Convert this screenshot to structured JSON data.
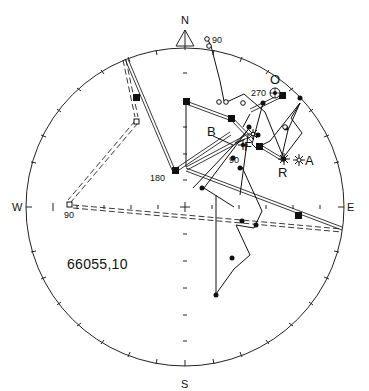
{
  "diagram": {
    "type": "stereonet",
    "caption": "66055,10",
    "compass": {
      "north": "N",
      "south": "S",
      "east": "E",
      "west": "W"
    },
    "labels": {
      "origin_marker": "O",
      "point_a": "A",
      "point_b": "B",
      "point_f": "F",
      "point_r": "R",
      "deg_90_top": "90",
      "deg_270": "270",
      "deg_90_mid": "90",
      "deg_180": "180",
      "deg_90_west": "90"
    },
    "colors": {
      "ink": "#111111",
      "background": "#ffffff"
    }
  }
}
